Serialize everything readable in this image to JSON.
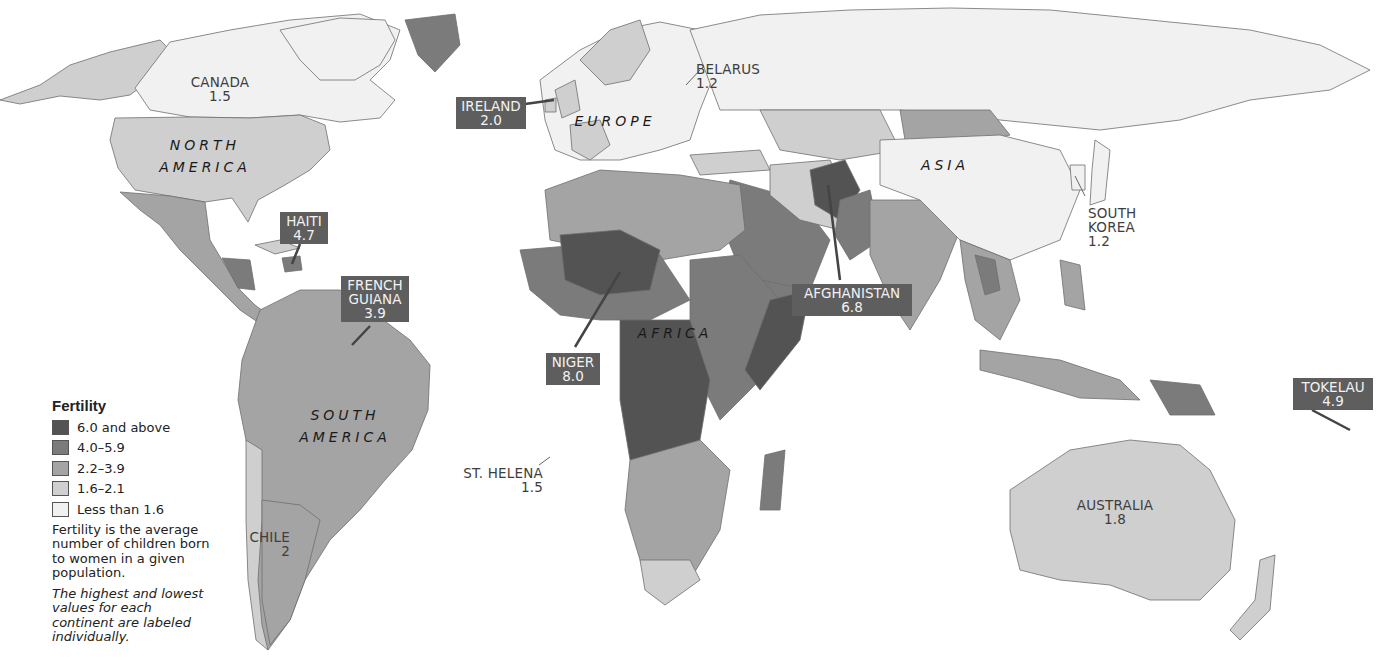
{
  "map": {
    "subject": "Fertility by country",
    "continents": [
      {
        "name": "NORTH",
        "name2": "AMERICA"
      },
      {
        "name": "SOUTH",
        "name2": "AMERICA"
      },
      {
        "name": "EUROPE"
      },
      {
        "name": "AFRICA"
      },
      {
        "name": "ASIA"
      }
    ],
    "plain_labels": [
      {
        "country": "CANADA",
        "value": "1.5"
      },
      {
        "country": "BELARUS",
        "value": "1.2"
      },
      {
        "country": "SOUTH",
        "country2": "KOREA",
        "value": "1.2"
      },
      {
        "country": "ST. HELENA",
        "value": "1.5"
      },
      {
        "country": "CHILE",
        "value": "2"
      },
      {
        "country": "AUSTRALIA",
        "value": "1.8"
      }
    ],
    "callouts": [
      {
        "country": "IRELAND",
        "value": "2.0"
      },
      {
        "country": "HAITI",
        "value": "4.7"
      },
      {
        "country": "FRENCH",
        "country2": "GUIANA",
        "value": "3.9"
      },
      {
        "country": "NIGER",
        "value": "8.0"
      },
      {
        "country": "AFGHANISTAN",
        "value": "6.8"
      },
      {
        "country": "TOKELAU",
        "value": "4.9"
      }
    ]
  },
  "legend": {
    "title": "Fertility",
    "items": [
      {
        "label": "6.0 and above",
        "color": "#535353"
      },
      {
        "label": "4.0–5.9",
        "color": "#7b7b7b"
      },
      {
        "label": "2.2–3.9",
        "color": "#a4a4a4"
      },
      {
        "label": "1.6–2.1",
        "color": "#cfcfcf"
      },
      {
        "label": "Less than 1.6",
        "color": "#f1f1f1"
      }
    ],
    "definition": "Fertility is the average number of children born to women in a given population.",
    "note": "The highest and lowest values for each continent are labeled individually."
  }
}
